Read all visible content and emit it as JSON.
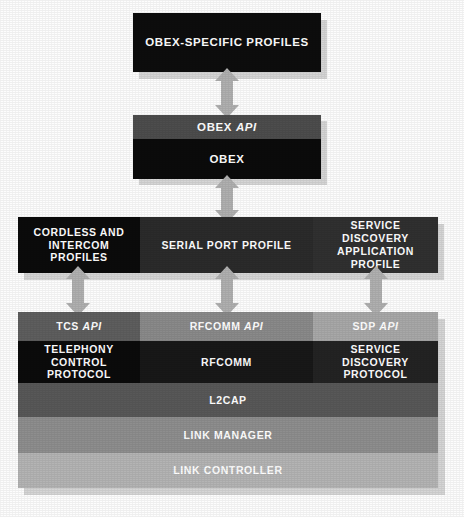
{
  "diagram": {
    "background_color": "#fdfdfd",
    "shadow_color": "#d5d5d5",
    "arrow_color": "#b0b0b0",
    "text_color": "#ffffff"
  },
  "blocks": {
    "obex_specific_profiles": {
      "label": "OBEX-SPECIFIC PROFILES",
      "color": "#0d0d0d"
    },
    "obex_api": {
      "label_plain": "OBEX ",
      "label_italic": "API",
      "color": "#4d4d4d"
    },
    "obex": {
      "label": "OBEX",
      "color": "#0b0b0b"
    },
    "cordless_intercom_profiles": {
      "label_line1": "CORDLESS AND",
      "label_line2": "INTERCOM PROFILES",
      "color": "#0b0b0b"
    },
    "serial_port_profile": {
      "label": "SERIAL PORT PROFILE",
      "color": "#2b2b2b"
    },
    "service_discovery_application_profile": {
      "label_line1": "SERVICE DISCOVERY",
      "label_line2": "APPLICATION PROFILE",
      "color": "#303030"
    },
    "tcs_api": {
      "label_plain": "TCS ",
      "label_italic": "API",
      "color": "#5e5e5e"
    },
    "rfcomm_api": {
      "label_plain": "RFCOMM ",
      "label_italic": "API",
      "color": "#8a8a8a"
    },
    "sdp_api": {
      "label_plain": "SDP ",
      "label_italic": "API",
      "color": "#a8a8a8"
    },
    "telephony_control_protocol": {
      "label_line1": "TELEPHONY CONTROL",
      "label_line2": "PROTOCOL",
      "color": "#0b0b0b"
    },
    "rfcomm": {
      "label": "RFCOMM",
      "color": "#181818"
    },
    "service_discovery_protocol": {
      "label_line1": "SERVICE DISCOVERY",
      "label_line2": "PROTOCOL",
      "color": "#232323"
    },
    "l2cap": {
      "label": "L2CAP",
      "color": "#585858"
    },
    "link_manager": {
      "label": "LINK MANAGER",
      "color": "#8e8e8e"
    },
    "link_controller": {
      "label": "LINK CONTROLLER",
      "color": "#b4b4b4"
    }
  },
  "arrows": [
    {
      "name": "arrow-obexprofiles-obexapi",
      "direction": "double",
      "connects": "OBEX-SPECIFIC PROFILES to OBEX API"
    },
    {
      "name": "arrow-obex-serialportprofile",
      "direction": "double",
      "connects": "OBEX to SERIAL PORT PROFILE"
    },
    {
      "name": "arrow-cordless-tcsapi",
      "direction": "double",
      "connects": "CORDLESS AND INTERCOM PROFILES to TCS API"
    },
    {
      "name": "arrow-serialport-rfcommapi",
      "direction": "double",
      "connects": "SERIAL PORT PROFILE to RFCOMM API"
    },
    {
      "name": "arrow-sdap-sdpapi",
      "direction": "double",
      "connects": "SERVICE DISCOVERY APPLICATION PROFILE to SDP API"
    }
  ]
}
